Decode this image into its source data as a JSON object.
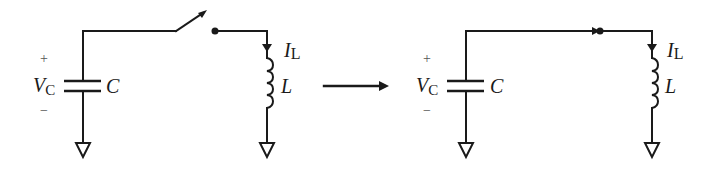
{
  "diagram": {
    "colors": {
      "stroke": "#1a1a1a",
      "background": "#ffffff",
      "sign": "#555555"
    },
    "transition_arrow": "right-arrow",
    "left_circuit": {
      "state": "switch open",
      "capacitor": {
        "label": "C",
        "voltage_label_main": "V",
        "voltage_label_sub": "C",
        "plus": "+",
        "minus": "−"
      },
      "inductor": {
        "label": "L",
        "current_label_main": "I",
        "current_label_sub": "L"
      },
      "switch": "open",
      "grounds": 2
    },
    "right_circuit": {
      "state": "switch closed",
      "capacitor": {
        "label": "C",
        "voltage_label_main": "V",
        "voltage_label_sub": "C",
        "plus": "+",
        "minus": "−"
      },
      "inductor": {
        "label": "L",
        "current_label_main": "I",
        "current_label_sub": "L"
      },
      "switch": "closed",
      "grounds": 2
    }
  }
}
